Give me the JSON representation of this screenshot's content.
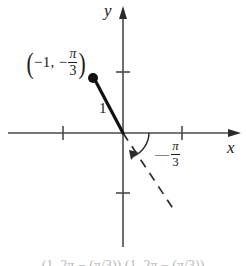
{
  "figure": {
    "axes": {
      "x_label": "x",
      "y_label": "y",
      "x_tick_values": [
        "-1",
        "1"
      ],
      "y_tick_values": [
        "1",
        "-1"
      ],
      "origin_label": "O"
    },
    "point_label": {
      "open_paren": "(",
      "text": "−1,  −",
      "frac_num": "π",
      "frac_den": "3",
      "close_paren": ")",
      "plain": "(−1, −π/3)"
    },
    "radius_label": "1",
    "angle_label": {
      "sign": "—",
      "frac_num": "π",
      "frac_den": "3",
      "plain": "−π/3"
    },
    "bottom_caption": "(1, 2π − (π/3))   (1, 2π − (π/3))",
    "colors": {
      "ink": "#1a1a1a",
      "axis": "#4a4a4a",
      "background": "#ffffff"
    },
    "geometry": {
      "origin_x": 123,
      "origin_y": 133,
      "point_x": 93,
      "point_y": 78,
      "dashed_end_x": 176,
      "dashed_end_y": 213,
      "angle_degrees": -60
    }
  }
}
